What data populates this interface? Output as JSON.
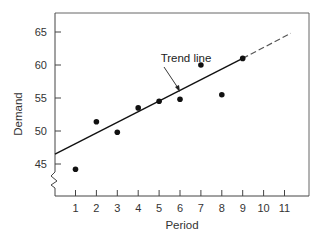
{
  "chart_data": {
    "type": "scatter",
    "title": "",
    "xlabel": "Period",
    "ylabel": "Demand",
    "xlim": [
      0,
      12
    ],
    "ylim": [
      41,
      68
    ],
    "x_ticks": [
      1,
      2,
      3,
      4,
      5,
      6,
      7,
      8,
      9,
      10,
      11
    ],
    "y_ticks": [
      45,
      50,
      55,
      60,
      65
    ],
    "grid": false,
    "y_axis_break": true,
    "series": [
      {
        "name": "Demand",
        "type": "scatter",
        "x": [
          1,
          2,
          3,
          4,
          5,
          6,
          7,
          8,
          9
        ],
        "values": [
          44.2,
          51.4,
          49.8,
          53.5,
          54.5,
          54.8,
          60.0,
          55.5,
          61.0
        ],
        "color": "#111111"
      },
      {
        "name": "Trend line",
        "type": "line",
        "x": [
          0,
          9
        ],
        "values": [
          46.5,
          61.0
        ],
        "style": "solid",
        "color": "#111111"
      },
      {
        "name": "Trend line (forecast)",
        "type": "line",
        "x": [
          9,
          11.3
        ],
        "values": [
          61.0,
          64.8
        ],
        "style": "dashed",
        "color": "#555555"
      }
    ],
    "annotations": [
      {
        "text": "Trend line",
        "x": 6.2,
        "y": 60.8,
        "arrow_to": {
          "x": 5.95,
          "y": 55.0
        }
      }
    ]
  },
  "labels": {
    "xlabel": "Period",
    "ylabel": "Demand",
    "annotation": "Trend line",
    "x_ticks": [
      "1",
      "2",
      "3",
      "4",
      "5",
      "6",
      "7",
      "8",
      "9",
      "10",
      "11"
    ],
    "y_ticks": [
      "45",
      "50",
      "55",
      "60",
      "65"
    ]
  }
}
